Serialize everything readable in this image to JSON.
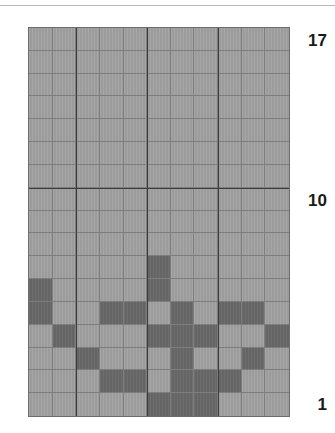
{
  "figure": {
    "kind": "grid-lattice-diagram",
    "columns": 11,
    "rows": 17,
    "colors": {
      "light_cell": "#9c9c9c",
      "dark_cell": "#656565",
      "minor_gridline": "#7d7d7d",
      "major_gridline": "#3c3c3c",
      "border": "#6d6d6d",
      "label_text": "#1a1a1a",
      "background": "#ffffff",
      "top_rule": "#b9b9b9"
    }
  },
  "axis_labels": {
    "top": "17",
    "middle": "10",
    "bottom": "1"
  },
  "grid": {
    "major_vertical_columns": [
      2,
      5,
      8
    ],
    "major_horizontal_rows": [
      7
    ],
    "note_rows_top_to_bottom": true,
    "cells": [
      [
        0,
        0,
        0,
        0,
        0,
        0,
        0,
        0,
        0,
        0,
        0
      ],
      [
        0,
        0,
        0,
        0,
        0,
        0,
        0,
        0,
        0,
        0,
        0
      ],
      [
        0,
        0,
        0,
        0,
        0,
        0,
        0,
        0,
        0,
        0,
        0
      ],
      [
        0,
        0,
        0,
        0,
        0,
        0,
        0,
        0,
        0,
        0,
        0
      ],
      [
        0,
        0,
        0,
        0,
        0,
        0,
        0,
        0,
        0,
        0,
        0
      ],
      [
        0,
        0,
        0,
        0,
        0,
        0,
        0,
        0,
        0,
        0,
        0
      ],
      [
        0,
        0,
        0,
        0,
        0,
        0,
        0,
        0,
        0,
        0,
        0
      ],
      [
        0,
        0,
        0,
        0,
        0,
        0,
        0,
        0,
        0,
        0,
        0
      ],
      [
        0,
        0,
        0,
        0,
        0,
        0,
        0,
        0,
        0,
        0,
        0
      ],
      [
        0,
        0,
        0,
        0,
        0,
        0,
        0,
        0,
        0,
        0,
        0
      ],
      [
        0,
        0,
        0,
        0,
        0,
        1,
        0,
        0,
        0,
        0,
        0
      ],
      [
        1,
        0,
        0,
        0,
        0,
        1,
        0,
        0,
        0,
        0,
        0
      ],
      [
        1,
        0,
        0,
        1,
        1,
        0,
        1,
        0,
        1,
        1,
        0
      ],
      [
        0,
        1,
        0,
        0,
        0,
        1,
        1,
        1,
        0,
        0,
        1
      ],
      [
        0,
        0,
        1,
        0,
        0,
        0,
        1,
        0,
        0,
        1,
        0
      ],
      [
        0,
        0,
        0,
        1,
        1,
        0,
        1,
        1,
        1,
        0,
        0
      ],
      [
        0,
        0,
        0,
        0,
        0,
        1,
        1,
        1,
        0,
        0,
        0
      ]
    ]
  }
}
